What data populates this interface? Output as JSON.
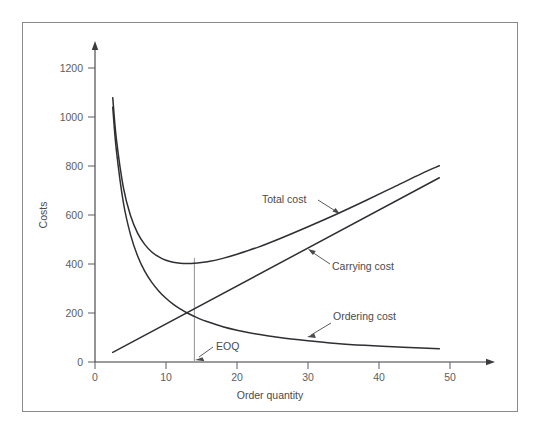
{
  "chart_data": {
    "type": "line",
    "title": "",
    "xlabel": "Order quantity",
    "ylabel": "Costs",
    "xlim": [
      0,
      54
    ],
    "ylim": [
      0,
      1280
    ],
    "grid": false,
    "legend_position": "inline-annotations",
    "x_ticks": [
      "0",
      "10",
      "20",
      "30",
      "40",
      "50"
    ],
    "x_tick_values": [
      0,
      10,
      20,
      30,
      40,
      50
    ],
    "y_ticks": [
      "0",
      "200",
      "400",
      "600",
      "800",
      "1000",
      "1200"
    ],
    "y_tick_values": [
      0,
      200,
      400,
      600,
      800,
      1000,
      1200
    ],
    "annotations": [
      {
        "text": "EOQ",
        "x": 14,
        "y": 60
      }
    ],
    "series": [
      {
        "name": "Total cost",
        "label": "Total cost",
        "kind": "curve",
        "formula": "2600/q + 15.5q",
        "x": [
          2.5,
          3,
          4,
          5,
          6,
          7,
          8,
          9,
          10,
          11,
          12,
          13,
          14,
          15,
          16,
          18,
          20,
          23,
          26,
          30,
          34,
          38,
          42,
          46,
          48.5
        ],
        "values": [
          1079,
          913,
          712,
          598,
          526,
          480,
          449,
          429,
          415,
          407,
          403,
          402,
          403,
          406,
          410,
          423,
          440,
          469,
          503,
          552,
          603,
          657,
          713,
          769,
          801
        ]
      },
      {
        "name": "Carrying cost",
        "label": "Carrying cost",
        "kind": "line",
        "formula": "15.5q",
        "x": [
          2.5,
          48.5
        ],
        "values": [
          39,
          752
        ]
      },
      {
        "name": "Ordering cost",
        "label": "Ordering cost",
        "kind": "curve",
        "formula": "2600/q",
        "x": [
          2.5,
          3,
          4,
          5,
          6,
          7,
          8,
          9,
          10,
          11,
          12,
          13,
          14,
          15,
          16,
          18,
          20,
          23,
          26,
          30,
          34,
          38,
          42,
          46,
          48.5
        ],
        "values": [
          1040,
          867,
          650,
          520,
          433,
          371,
          325,
          289,
          260,
          236,
          217,
          200,
          186,
          173,
          163,
          144,
          130,
          113,
          100,
          87,
          76,
          68,
          62,
          57,
          54
        ]
      }
    ],
    "eoq": {
      "label": "EOQ",
      "quantity": 14,
      "intersection_cost": 215,
      "total_cost_at_eoq": 425
    },
    "colors": {
      "curve": "#2f2f33",
      "axis": "#3b3b3e",
      "text": "#4a4a4d",
      "tick_text": "#5d5d60",
      "eoq_line": "#9a9a9e",
      "frame": "#8a8a8e",
      "background": "#ffffff"
    }
  }
}
